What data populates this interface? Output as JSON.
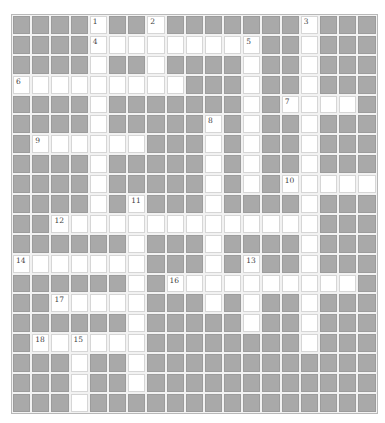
{
  "puzzle": {
    "cols": 19,
    "rows": 20,
    "colors": {
      "block": "#a9a9a9",
      "open": "#ffffff",
      "gridline": "#f2f2f2",
      "number_text": "#444444"
    },
    "open_cells": [
      [
        4,
        7,
        15
      ],
      [
        4,
        5,
        6,
        7,
        8,
        9,
        10,
        11,
        12,
        15
      ],
      [
        4,
        7,
        12,
        15
      ],
      [
        0,
        1,
        2,
        3,
        4,
        5,
        6,
        7,
        8,
        12,
        15
      ],
      [
        4,
        12,
        14,
        15,
        16,
        17
      ],
      [
        4,
        10,
        12,
        15
      ],
      [
        1,
        2,
        3,
        4,
        5,
        6,
        10,
        12,
        15
      ],
      [
        4,
        10,
        12,
        15
      ],
      [
        4,
        10,
        12,
        14,
        15,
        16,
        17,
        18
      ],
      [
        4,
        6,
        10,
        15
      ],
      [
        2,
        3,
        4,
        5,
        6,
        7,
        8,
        9,
        10,
        11,
        12,
        13,
        14,
        15
      ],
      [
        6,
        10,
        15
      ],
      [
        0,
        1,
        2,
        3,
        4,
        5,
        6,
        10,
        12,
        15
      ],
      [
        6,
        8,
        9,
        10,
        11,
        12,
        13,
        14,
        15,
        16,
        17
      ],
      [
        2,
        3,
        4,
        5,
        6,
        10,
        12,
        15
      ],
      [
        6,
        12,
        15
      ],
      [
        1,
        2,
        3,
        4,
        5,
        6,
        15
      ],
      [
        3,
        6
      ],
      [
        3,
        6
      ],
      [
        3
      ]
    ],
    "numbers": [
      {
        "row": 0,
        "col": 4,
        "label": "1"
      },
      {
        "row": 0,
        "col": 7,
        "label": "2"
      },
      {
        "row": 0,
        "col": 15,
        "label": "3"
      },
      {
        "row": 1,
        "col": 4,
        "label": "4"
      },
      {
        "row": 1,
        "col": 12,
        "label": "5"
      },
      {
        "row": 3,
        "col": 0,
        "label": "6"
      },
      {
        "row": 4,
        "col": 14,
        "label": "7"
      },
      {
        "row": 5,
        "col": 10,
        "label": "8"
      },
      {
        "row": 6,
        "col": 1,
        "label": "9"
      },
      {
        "row": 8,
        "col": 14,
        "label": "10"
      },
      {
        "row": 9,
        "col": 6,
        "label": "11"
      },
      {
        "row": 10,
        "col": 2,
        "label": "12"
      },
      {
        "row": 12,
        "col": 12,
        "label": "13"
      },
      {
        "row": 12,
        "col": 0,
        "label": "14"
      },
      {
        "row": 16,
        "col": 3,
        "label": "15"
      },
      {
        "row": 13,
        "col": 8,
        "label": "16"
      },
      {
        "row": 14,
        "col": 2,
        "label": "17"
      },
      {
        "row": 16,
        "col": 1,
        "label": "18"
      }
    ],
    "entries": {
      "across": [
        {
          "number": "4",
          "row": 1,
          "col": 4,
          "length": 9
        },
        {
          "number": "6",
          "row": 3,
          "col": 0,
          "length": 9
        },
        {
          "number": "7",
          "row": 4,
          "col": 14,
          "length": 4
        },
        {
          "number": "9",
          "row": 6,
          "col": 1,
          "length": 6
        },
        {
          "number": "10",
          "row": 8,
          "col": 14,
          "length": 5
        },
        {
          "number": "12",
          "row": 10,
          "col": 2,
          "length": 14
        },
        {
          "number": "14",
          "row": 12,
          "col": 0,
          "length": 7
        },
        {
          "number": "16",
          "row": 13,
          "col": 8,
          "length": 10
        },
        {
          "number": "17",
          "row": 14,
          "col": 2,
          "length": 5
        },
        {
          "number": "18",
          "row": 16,
          "col": 1,
          "length": 6
        }
      ],
      "down": [
        {
          "number": "1",
          "row": 0,
          "col": 4,
          "length": 11
        },
        {
          "number": "2",
          "row": 0,
          "col": 7,
          "length": 4
        },
        {
          "number": "3",
          "row": 0,
          "col": 15,
          "length": 17
        },
        {
          "number": "5",
          "row": 1,
          "col": 12,
          "length": 8
        },
        {
          "number": "8",
          "row": 5,
          "col": 10,
          "length": 10
        },
        {
          "number": "11",
          "row": 9,
          "col": 6,
          "length": 10
        },
        {
          "number": "13",
          "row": 12,
          "col": 12,
          "length": 4
        },
        {
          "number": "15",
          "row": 16,
          "col": 3,
          "length": 4
        }
      ]
    }
  }
}
